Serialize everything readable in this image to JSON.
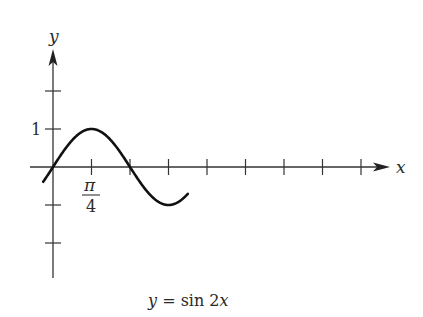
{
  "chart_data": {
    "type": "line",
    "title": "y = sin 2x",
    "caption": "y = sin 2x",
    "function": "sin(2x)",
    "xlabel": "x",
    "ylabel": "y",
    "x_tick_step": "π/4",
    "x_tick_labels": [
      {
        "value": 0.7854,
        "label": "π/4",
        "numerator": "π",
        "denominator": "4"
      }
    ],
    "y_tick_labels": [
      {
        "value": 1,
        "label": "1"
      }
    ],
    "y_ticks": [
      2,
      1,
      -1,
      -2
    ],
    "x_ticks_multiples_of_pi_over_4": [
      1,
      2,
      3,
      4,
      5,
      6,
      7,
      8
    ],
    "xlim": [
      -0.2,
      2.75
    ],
    "ylim": [
      -2.9,
      2.3
    ],
    "x": [
      -0.2,
      0,
      0.3927,
      0.7854,
      1.1781,
      1.5708,
      1.9635,
      2.3562,
      2.7489,
      3.1416,
      3.5343,
      3.927,
      4.3197,
      4.7124,
      5.1051,
      5.4978,
      5.8905,
      6.2832,
      6.55
    ],
    "values": [
      -0.389,
      0,
      0.707,
      1,
      0.707,
      0,
      -0.707,
      -1,
      -0.707,
      0,
      0.707,
      1,
      0.707,
      0,
      -0.707,
      -1,
      -0.707,
      0,
      0.495
    ],
    "grid": false,
    "legend": null
  },
  "labels": {
    "y_axis": "y",
    "x_axis": "x",
    "tick_one": "1",
    "pi_num": "π",
    "pi_den": "4",
    "caption": "y = sin 2x"
  }
}
